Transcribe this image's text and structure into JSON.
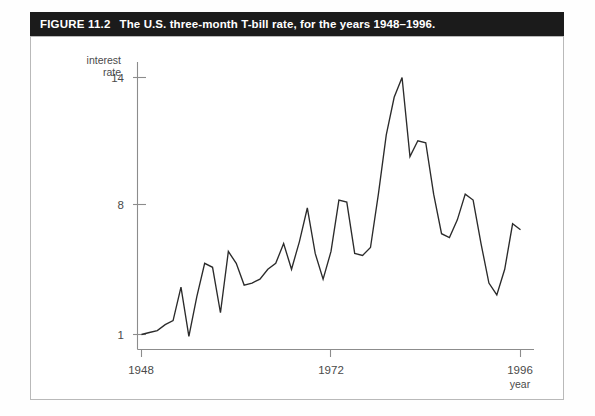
{
  "figure": {
    "label": "FIGURE 11.2",
    "caption": "The U.S. three-month T-bill rate, for the years 1948–1996.",
    "bar_color": "#1b1b1b",
    "bar_text_color": "#ffffff",
    "line_color": "#2b2b2b",
    "axis_color": "#8c8c8c"
  },
  "axes": {
    "y_label_line1": "interest",
    "y_label_line2": "rate",
    "x_label": "year",
    "y_ticks": [
      "1",
      "8",
      "14"
    ],
    "x_ticks": [
      "1948",
      "1972",
      "1996"
    ]
  },
  "chart_data": {
    "type": "line",
    "title": "The U.S. three-month T-bill rate, for the years 1948–1996.",
    "xlabel": "year",
    "ylabel": "interest rate",
    "xlim": [
      1948,
      1996
    ],
    "ylim": [
      0,
      15
    ],
    "grid": false,
    "legend": "none",
    "y_tick_values": [
      1,
      8,
      14
    ],
    "x_tick_values": [
      1948,
      1972,
      1996
    ],
    "x": [
      1948,
      1949,
      1950,
      1951,
      1952,
      1953,
      1954,
      1955,
      1956,
      1957,
      1958,
      1959,
      1960,
      1961,
      1962,
      1963,
      1964,
      1965,
      1966,
      1967,
      1968,
      1969,
      1970,
      1971,
      1972,
      1973,
      1974,
      1975,
      1976,
      1977,
      1978,
      1979,
      1980,
      1981,
      1982,
      1983,
      1984,
      1985,
      1986,
      1987,
      1988,
      1989,
      1990,
      1991,
      1992,
      1993,
      1994,
      1995,
      1996
    ],
    "values": [
      1.0,
      1.1,
      1.2,
      1.5,
      1.7,
      3.4,
      0.9,
      2.9,
      4.6,
      4.4,
      2.1,
      5.2,
      4.6,
      3.5,
      3.6,
      3.8,
      4.3,
      4.6,
      5.6,
      4.3,
      5.7,
      7.4,
      5.1,
      3.8,
      5.2,
      7.8,
      7.7,
      5.1,
      5.0,
      5.4,
      8.1,
      11.1,
      13.0,
      14.0,
      10.0,
      10.8,
      10.7,
      8.1,
      6.1,
      5.9,
      6.8,
      8.1,
      7.8,
      5.6,
      3.6,
      3.0,
      4.3,
      6.6,
      6.3
    ],
    "series": [
      {
        "name": "U.S. three-month T-bill rate",
        "values": [
          1.0,
          1.1,
          1.2,
          1.5,
          1.7,
          3.4,
          0.9,
          2.9,
          4.6,
          4.4,
          2.1,
          5.2,
          4.6,
          3.5,
          3.6,
          3.8,
          4.3,
          4.6,
          5.6,
          4.3,
          5.7,
          7.4,
          5.1,
          3.8,
          5.2,
          7.8,
          7.7,
          5.1,
          5.0,
          5.4,
          8.1,
          11.1,
          13.0,
          14.0,
          10.0,
          10.8,
          10.7,
          8.1,
          6.1,
          5.9,
          6.8,
          8.1,
          7.8,
          5.6,
          3.6,
          3.0,
          4.3,
          6.6,
          6.3
        ]
      }
    ]
  }
}
